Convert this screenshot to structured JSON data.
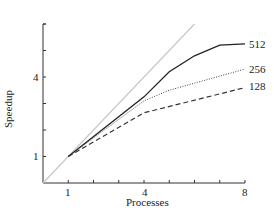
{
  "chart_data": {
    "type": "line",
    "title": "",
    "xlabel": "Processes",
    "ylabel": "Speedup",
    "x": [
      1,
      2,
      3,
      4,
      5,
      6,
      7,
      8
    ],
    "xlim": [
      0,
      8
    ],
    "ylim": [
      0,
      6
    ],
    "xticks": [
      1,
      2,
      3,
      4,
      5,
      6,
      7,
      8
    ],
    "xtick_labels": [
      "1",
      "",
      "",
      "4",
      "",
      "",
      "",
      "8"
    ],
    "yticks": [
      1,
      2,
      3,
      4,
      5,
      6
    ],
    "ytick_labels": [
      "1",
      "",
      "",
      "4",
      "",
      ""
    ],
    "grid": false,
    "series": [
      {
        "name": "ideal",
        "style": "solid-light",
        "x": [
          0,
          6
        ],
        "values": [
          0,
          6
        ]
      },
      {
        "name": "512",
        "style": "solid",
        "x": [
          1,
          4,
          5,
          6,
          7,
          8
        ],
        "values": [
          1,
          3.25,
          4.2,
          4.8,
          5.2,
          5.25
        ]
      },
      {
        "name": "256",
        "style": "dotted",
        "x": [
          1,
          4,
          5,
          8
        ],
        "values": [
          1,
          3.1,
          3.5,
          4.3
        ]
      },
      {
        "name": "128",
        "style": "dashed",
        "x": [
          1,
          4,
          8
        ],
        "values": [
          1,
          2.65,
          3.6
        ]
      }
    ],
    "legend": "inline labels at line ends"
  },
  "labels": {
    "x_axis": "Processes",
    "y_axis": "Speedup",
    "x1": "1",
    "x4": "4",
    "x8": "8",
    "y1": "1",
    "y4": "4",
    "s512": "512",
    "s256": "256",
    "s128": "128"
  }
}
